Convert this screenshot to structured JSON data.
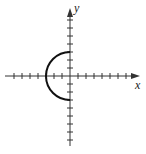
{
  "chart_data": {
    "type": "line",
    "title": "",
    "xlabel": "x",
    "ylabel": "y",
    "equation": "x = -√(9 − y²)",
    "x_ticks": [
      -7,
      -6,
      -5,
      -4,
      -3,
      -2,
      -1,
      1,
      2,
      3,
      4,
      5,
      6,
      7
    ],
    "y_ticks": [
      -8,
      -7,
      -6,
      -5,
      -4,
      -3,
      -2,
      -1,
      1,
      2,
      3,
      4,
      5,
      6,
      7,
      8
    ],
    "tick_labels_shown": false,
    "xlim": [
      -8,
      9
    ],
    "ylim": [
      -8.5,
      8.5
    ],
    "grid": false,
    "series": [
      {
        "name": "semicircle",
        "radius": 3,
        "center": [
          0,
          0
        ],
        "half": "left",
        "points": [
          [
            0,
            3
          ],
          [
            -1.5,
            2.6
          ],
          [
            -2.6,
            1.5
          ],
          [
            -3,
            0
          ],
          [
            -2.6,
            -1.5
          ],
          [
            -1.5,
            -2.6
          ],
          [
            0,
            -3
          ]
        ]
      }
    ]
  },
  "axes": {
    "x_label": "x",
    "y_label": "y"
  },
  "colors": {
    "axis": "#333333",
    "curve": "#111111",
    "background": "#ffffff"
  }
}
